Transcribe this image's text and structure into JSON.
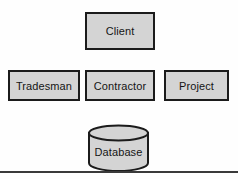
{
  "diagram": {
    "type": "architecture-block-diagram",
    "background_color": "#fefefe",
    "node_fill_color": "#d4d4d4",
    "node_border_color": "#1b1b1b",
    "divider_color": "#3a3a3a",
    "rows": [
      {
        "row_index": 0,
        "nodes": [
          {
            "id": "client",
            "label": "Client",
            "shape": "rectangle"
          }
        ]
      },
      {
        "row_index": 1,
        "nodes": [
          {
            "id": "tradesman",
            "label": "Tradesman",
            "shape": "rectangle"
          },
          {
            "id": "contractor",
            "label": "Contractor",
            "shape": "rectangle"
          },
          {
            "id": "project",
            "label": "Project",
            "shape": "rectangle"
          }
        ]
      },
      {
        "row_index": 2,
        "nodes": [
          {
            "id": "database",
            "label": "Database",
            "shape": "cylinder"
          }
        ]
      }
    ]
  }
}
